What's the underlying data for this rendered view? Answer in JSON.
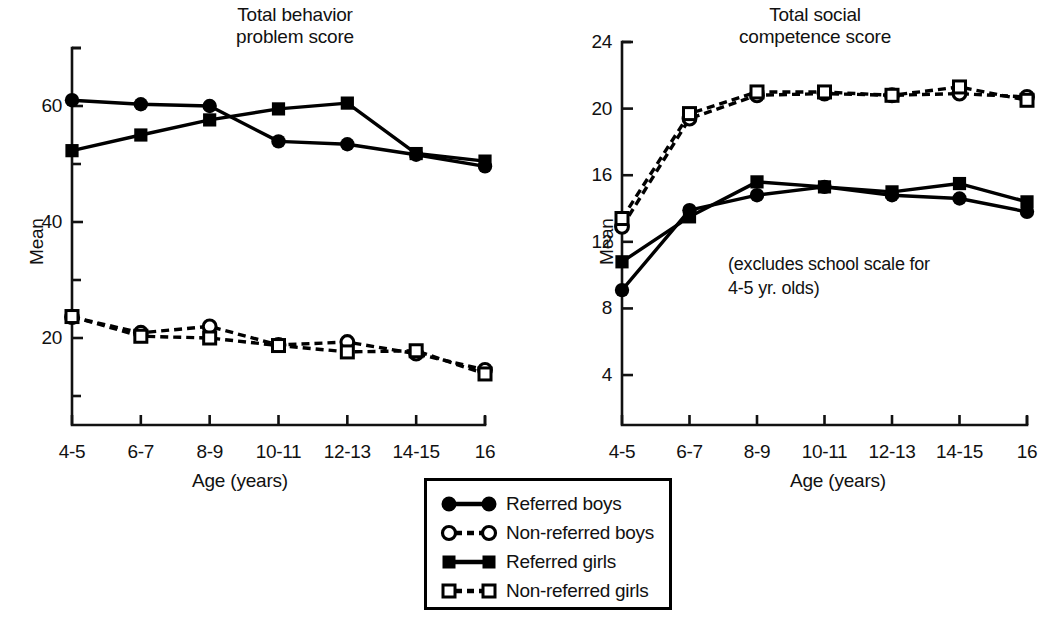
{
  "figure": {
    "x_axis_label": "Age (years)",
    "y_axis_label": "Mean",
    "age_categories": [
      "4-5",
      "6-7",
      "8-9",
      "10-11",
      "12-13",
      "14-15",
      "16"
    ]
  },
  "legend": {
    "items": [
      {
        "label": "Referred boys",
        "marker": "filled-circle",
        "line": "solid"
      },
      {
        "label": "Non-referred boys",
        "marker": "open-circle",
        "line": "dashed"
      },
      {
        "label": "Referred girls",
        "marker": "filled-square",
        "line": "solid"
      },
      {
        "label": "Non-referred girls",
        "marker": "open-square",
        "line": "dashed"
      }
    ]
  },
  "chart_data": [
    {
      "id": "behavior",
      "type": "line",
      "title": "Total behavior\nproblem score",
      "xlabel": "Age (years)",
      "ylabel": "Mean",
      "categories": [
        "4-5",
        "6-7",
        "8-9",
        "10-11",
        "12-13",
        "14-15",
        "16"
      ],
      "ylim": [
        5,
        70
      ],
      "yticks_major": [
        20,
        40,
        60
      ],
      "yticks_minor": [
        10,
        30,
        50,
        70
      ],
      "grid": false,
      "legend_position": "below-between-panels",
      "series": [
        {
          "name": "Referred boys",
          "marker": "filled-circle",
          "line": "solid",
          "values": [
            61.0,
            60.3,
            60.0,
            53.9,
            53.4,
            51.6,
            49.6
          ]
        },
        {
          "name": "Non-referred boys",
          "marker": "open-circle",
          "line": "dashed",
          "values": [
            23.6,
            20.9,
            22.0,
            18.8,
            19.3,
            17.3,
            14.5
          ]
        },
        {
          "name": "Referred girls",
          "marker": "filled-square",
          "line": "solid",
          "values": [
            52.3,
            55.0,
            57.6,
            59.5,
            60.5,
            51.8,
            50.5
          ]
        },
        {
          "name": "Non-referred girls",
          "marker": "open-square",
          "line": "dashed",
          "values": [
            23.7,
            20.3,
            20.0,
            18.7,
            17.6,
            17.8,
            13.8
          ]
        }
      ]
    },
    {
      "id": "social",
      "type": "line",
      "title": "Total social\ncompetence score",
      "subtitle": "(excludes school scale for\n4-5 yr. olds)",
      "xlabel": "Age (years)",
      "ylabel": "Mean",
      "categories": [
        "4-5",
        "6-7",
        "8-9",
        "10-11",
        "12-13",
        "14-15",
        "16"
      ],
      "ylim": [
        1,
        24
      ],
      "yticks_major": [
        4,
        8,
        12,
        16,
        20,
        24
      ],
      "grid": false,
      "series": [
        {
          "name": "Referred boys",
          "marker": "filled-circle",
          "line": "solid",
          "values": [
            9.1,
            13.9,
            14.8,
            15.3,
            14.8,
            14.6,
            13.8
          ]
        },
        {
          "name": "Non-referred boys",
          "marker": "open-circle",
          "line": "dashed",
          "values": [
            12.9,
            19.4,
            20.8,
            20.9,
            20.8,
            20.9,
            20.7
          ]
        },
        {
          "name": "Referred girls",
          "marker": "filled-square",
          "line": "solid",
          "values": [
            10.8,
            13.5,
            15.6,
            15.3,
            15.0,
            15.5,
            14.4
          ]
        },
        {
          "name": "Non-referred girls",
          "marker": "open-square",
          "line": "dashed",
          "values": [
            13.4,
            19.7,
            21.0,
            21.0,
            20.8,
            21.3,
            20.5
          ]
        }
      ]
    }
  ]
}
